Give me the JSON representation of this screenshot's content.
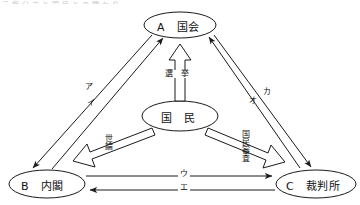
{
  "diagram": {
    "title_cut_off": "三権分立と国民との関わり",
    "nodes": [
      {
        "id": "A",
        "key": "A",
        "name": "国会",
        "full": "A　国会",
        "cx": 180,
        "cy": 25,
        "rx": 36,
        "ry": 13
      },
      {
        "id": "B",
        "key": "B",
        "name": "内閣",
        "full": "B　内閣",
        "cx": 47,
        "cy": 184,
        "rx": 38,
        "ry": 14
      },
      {
        "id": "C",
        "key": "C",
        "name": "裁判所",
        "full": "C　裁判所",
        "cx": 316,
        "cy": 184,
        "rx": 40,
        "ry": 14
      },
      {
        "id": "P",
        "key": "",
        "name": "国　民",
        "full": "国　民",
        "cx": 180,
        "cy": 116,
        "rx": 38,
        "ry": 15
      }
    ],
    "edges": [
      {
        "id": "a",
        "label": "ア",
        "from": "A",
        "to": "B",
        "style": "thin-arrow",
        "orient": "vertical"
      },
      {
        "id": "i",
        "label": "イ",
        "from": "B",
        "to": "A",
        "style": "thin-arrow",
        "orient": "vertical"
      },
      {
        "id": "u",
        "label": "ウ",
        "from": "B",
        "to": "C",
        "style": "thin-arrow",
        "orient": "horizontal"
      },
      {
        "id": "e",
        "label": "エ",
        "from": "C",
        "to": "B",
        "style": "thin-arrow",
        "orient": "horizontal"
      },
      {
        "id": "o",
        "label": "オ",
        "from": "C",
        "to": "A",
        "style": "thin-arrow",
        "orient": "vertical"
      },
      {
        "id": "ka",
        "label": "カ",
        "from": "A",
        "to": "C",
        "style": "thin-arrow",
        "orient": "vertical"
      },
      {
        "id": "senkyo",
        "label": "選　挙",
        "from": "P",
        "to": "A",
        "style": "block-arrow",
        "orient": "horizontal"
      },
      {
        "id": "yoron",
        "label": "世論",
        "from": "P",
        "to": "B",
        "style": "block-arrow",
        "orient": "vertical"
      },
      {
        "id": "shinsa",
        "label": "国民審査",
        "from": "P",
        "to": "C",
        "style": "block-arrow",
        "orient": "vertical"
      }
    ],
    "colors": {
      "stroke": "#1a1a1a",
      "background": "#ffffff",
      "text": "#111111"
    }
  }
}
